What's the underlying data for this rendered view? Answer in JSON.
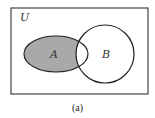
{
  "diagram": {
    "type": "venn",
    "universe_label": "U",
    "sets": [
      {
        "label": "A",
        "shape": "ellipse"
      },
      {
        "label": "B",
        "shape": "circle"
      }
    ],
    "shaded_region": "A minus B",
    "caption": "(a)",
    "colors": {
      "shade": "#a9a9a9",
      "stroke": "#222222",
      "background": "#ffffff"
    }
  }
}
